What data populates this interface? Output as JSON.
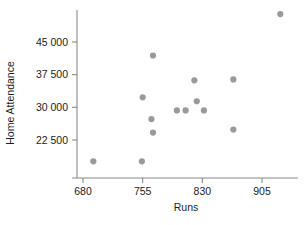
{
  "chart_data": {
    "type": "scatter",
    "title": "",
    "xlabel": "Runs",
    "ylabel": "Home Attendance",
    "xlim": [
      655,
      945
    ],
    "ylim": [
      15000,
      53000
    ],
    "grid": false,
    "legend": null,
    "xticks": [
      680,
      755,
      830,
      905
    ],
    "xtick_labels": [
      "680",
      "755",
      "830",
      "905"
    ],
    "yticks": [
      22500,
      30000,
      37500,
      45000
    ],
    "ytick_labels": [
      "22 500",
      "30 000",
      "37 500",
      "45 000"
    ],
    "marker_color": "#9a9a9a",
    "axis_color": "#8a8a8a",
    "text_color": "#1c1c1c",
    "points": [
      {
        "x": 693,
        "y": 17600
      },
      {
        "x": 754,
        "y": 17600
      },
      {
        "x": 755,
        "y": 32300
      },
      {
        "x": 766,
        "y": 27300
      },
      {
        "x": 768,
        "y": 41900
      },
      {
        "x": 768,
        "y": 24200
      },
      {
        "x": 798,
        "y": 29300
      },
      {
        "x": 809,
        "y": 29300
      },
      {
        "x": 820,
        "y": 36200
      },
      {
        "x": 823,
        "y": 31400
      },
      {
        "x": 832,
        "y": 29300
      },
      {
        "x": 869,
        "y": 36400
      },
      {
        "x": 869,
        "y": 24900
      },
      {
        "x": 928,
        "y": 51400
      }
    ]
  },
  "axes": {
    "y_axis_title": "Home Attendance",
    "x_axis_title": "Runs"
  }
}
